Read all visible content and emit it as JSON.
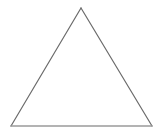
{
  "canvas": {
    "width": 165,
    "height": 140,
    "background_color": "#ffffff"
  },
  "figure": {
    "name": "triangle",
    "shape_type": "triangle",
    "classification": "isosceles",
    "filled": false,
    "fill_color": "none",
    "label": "",
    "vertices": [
      {
        "name": "apex",
        "x": 81,
        "y": 8
      },
      {
        "name": "bottom-right",
        "x": 152,
        "y": 126
      },
      {
        "name": "bottom-left",
        "x": 11,
        "y": 126
      }
    ],
    "edges": [
      {
        "name": "left-side",
        "from": "bottom-left",
        "to": "apex",
        "x1": 11,
        "y1": 126,
        "x2": 81,
        "y2": 8,
        "stroke_color": "#6b6b6b",
        "stroke_width": 1.2
      },
      {
        "name": "right-side",
        "from": "apex",
        "to": "bottom-right",
        "x1": 81,
        "y1": 8,
        "x2": 152,
        "y2": 126,
        "stroke_color": "#6b6b6b",
        "stroke_width": 1.2
      },
      {
        "name": "base",
        "from": "bottom-right",
        "to": "bottom-left",
        "x1": 152,
        "y1": 126,
        "x2": 11,
        "y2": 126,
        "stroke_color": "#9a9a9a",
        "stroke_width": 1.6
      }
    ],
    "outline_path": "M 11 126 L 81 8 L 152 126 Z"
  }
}
